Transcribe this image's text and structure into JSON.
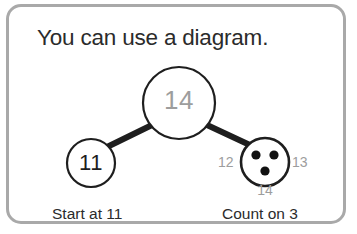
{
  "card": {
    "border_color": "#a9a9a9",
    "background": "#ffffff"
  },
  "title": "You can use a diagram.",
  "diagram": {
    "type": "number-bond",
    "total": {
      "value": "14",
      "text_color": "#9d9d9d",
      "outline_color": "#1e1e1e"
    },
    "part_left": {
      "value": "11",
      "text_color": "#1e1e1e",
      "outline_color": "#1e1e1e"
    },
    "part_right": {
      "dot_count": 3,
      "dot_color": "#111111",
      "outline_color": "#1e1e1e",
      "count_on_labels": {
        "left": "12",
        "right": "13",
        "below": "14"
      }
    },
    "connector_color": "#1e1e1e"
  },
  "captions": {
    "left": "Start at 11",
    "right": "Count on 3"
  }
}
